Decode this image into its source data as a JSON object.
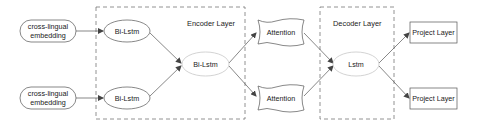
{
  "diagram": {
    "groups": [
      {
        "id": "encoder",
        "label": "Encoder Layer"
      },
      {
        "id": "decoder",
        "label": "Decoder Layer"
      }
    ],
    "nodes": {
      "embedding_top": {
        "line1": "cross-lingual",
        "line2": "embedding",
        "shape": "rounded-rect"
      },
      "embedding_bottom": {
        "line1": "cross-lingual",
        "line2": "embedding",
        "shape": "rounded-rect"
      },
      "bilstm_top": {
        "label": "Bi-Lstm",
        "shape": "ellipse"
      },
      "bilstm_bottom": {
        "label": "Bi-Lstm",
        "shape": "ellipse"
      },
      "bilstm_center": {
        "label": "Bi-Lstm",
        "shape": "ellipse"
      },
      "attention_top": {
        "label": "Attention",
        "shape": "tape"
      },
      "attention_bottom": {
        "label": "Attention",
        "shape": "tape"
      },
      "lstm": {
        "label": "Lstm",
        "shape": "ellipse"
      },
      "project_top": {
        "label": "Project Layer",
        "shape": "rect"
      },
      "project_bottom": {
        "label": "Project Layer",
        "shape": "rect"
      }
    },
    "edges": [
      [
        "embedding_top",
        "bilstm_top"
      ],
      [
        "embedding_bottom",
        "bilstm_bottom"
      ],
      [
        "bilstm_top",
        "bilstm_center"
      ],
      [
        "bilstm_bottom",
        "bilstm_center"
      ],
      [
        "bilstm_center",
        "attention_top"
      ],
      [
        "bilstm_center",
        "attention_bottom"
      ],
      [
        "attention_top",
        "lstm"
      ],
      [
        "attention_bottom",
        "lstm"
      ],
      [
        "lstm",
        "project_top"
      ],
      [
        "lstm",
        "project_bottom"
      ]
    ],
    "colors": {
      "stroke": "#555555",
      "light_stroke": "#c8c8c8",
      "dashed": "#777777",
      "fill": "#ffffff",
      "text": "#1a1a1a"
    }
  }
}
